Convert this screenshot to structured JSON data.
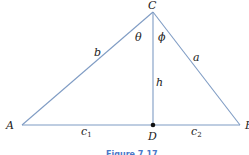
{
  "diagram": {
    "type": "triangle-with-altitude",
    "vertices": {
      "A": "A",
      "B": "B",
      "C": "C",
      "D": "D"
    },
    "sides": {
      "a": "a",
      "b": "b",
      "h": "h",
      "c1": "c",
      "c1_sub": "1",
      "c2": "c",
      "c2_sub": "2"
    },
    "angles": {
      "theta": "θ",
      "phi": "ϕ"
    },
    "caption": "Figure 7.17",
    "colors": {
      "line": "#7f9cc4",
      "point": "#111111",
      "caption": "#4a78c8"
    }
  }
}
